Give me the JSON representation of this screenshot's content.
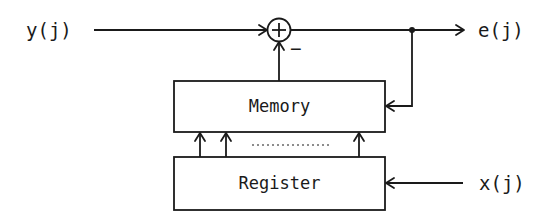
{
  "diagram": {
    "type": "block-diagram",
    "inputs": {
      "y": "y(j)",
      "x": "x(j)"
    },
    "outputs": {
      "e": "e(j)"
    },
    "summer": {
      "symbol": "+",
      "negative_input_sign": "−"
    },
    "blocks": {
      "memory": "Memory",
      "register": "Register"
    },
    "colors": {
      "stroke": "#1a1a1a",
      "background": "#ffffff"
    }
  }
}
